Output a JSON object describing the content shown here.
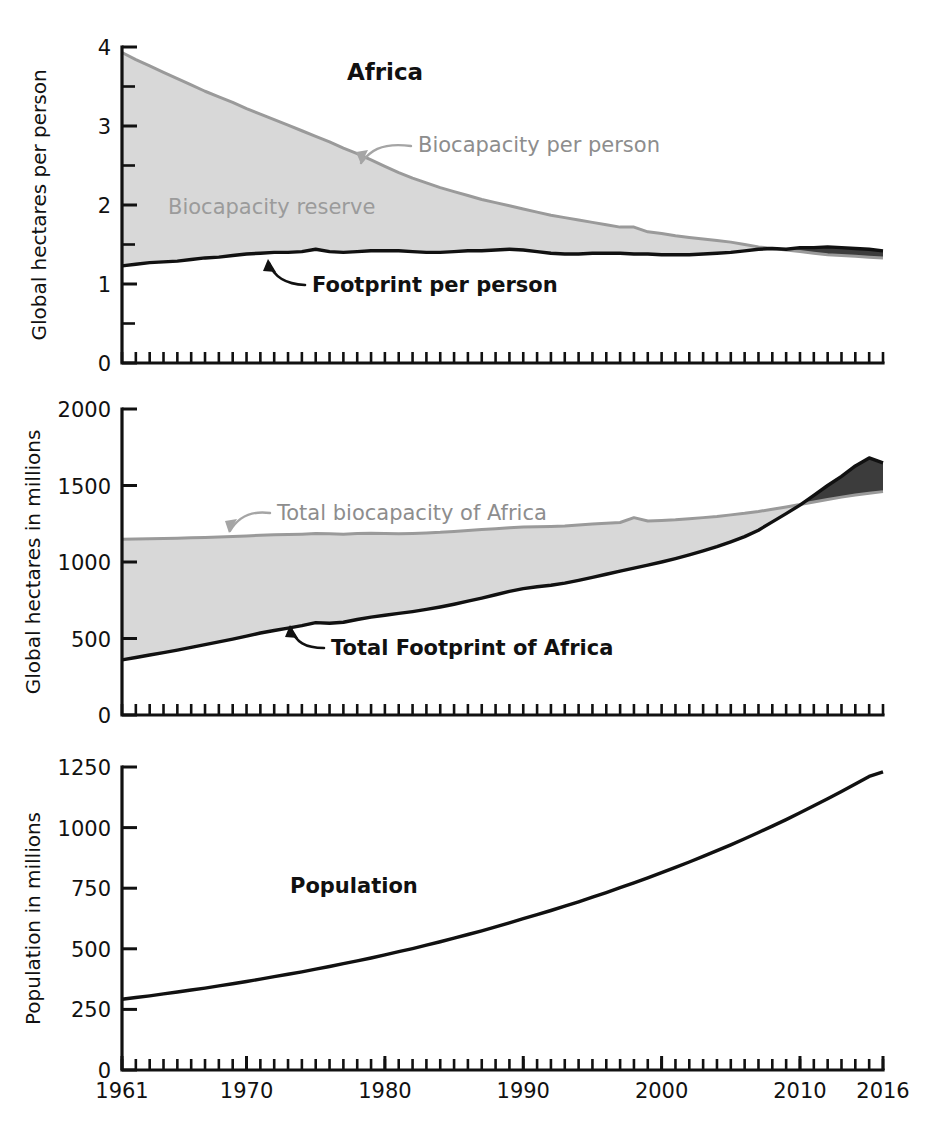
{
  "figure": {
    "title": "Africa",
    "x_axis": {
      "label": "",
      "ticks": [
        1961,
        1970,
        1980,
        1990,
        2000,
        2010,
        2016
      ],
      "tick_labels": [
        "1961",
        "1970",
        "1980",
        "1990",
        "2000",
        "2010",
        "2016"
      ],
      "range": [
        1961,
        2016
      ],
      "minor_tick_interval": 1
    },
    "colors": {
      "reserve_fill": "#d8d8d8",
      "overshoot_fill": "#3c3c3c",
      "biocapacity_line": "#9a9a9a",
      "footprint_line": "#111111",
      "annotation_gray": "#8d8d8d",
      "annotation_dark": "#111111",
      "background": "#ffffff"
    }
  },
  "panels": [
    {
      "id": "per-person",
      "ylabel": "Global hectares per person",
      "ytick_labels": [
        "0",
        "1",
        "2",
        "3",
        "4"
      ],
      "annotations": {
        "title": "Africa",
        "biocapacity": "Biocapacity per person",
        "reserve": "Biocapacity reserve",
        "footprint": "Footprint per person"
      }
    },
    {
      "id": "total",
      "ylabel": "Global hectares in millions",
      "ytick_labels": [
        "0",
        "500",
        "1000",
        "1500",
        "2000"
      ],
      "annotations": {
        "biocapacity": "Total biocapacity of Africa",
        "footprint": "Total Footprint of Africa"
      }
    },
    {
      "id": "population",
      "ylabel": "Population in millions",
      "ytick_labels": [
        "0",
        "250",
        "500",
        "750",
        "1000",
        "1250"
      ],
      "annotations": {
        "population": "Population"
      }
    }
  ],
  "chart_data": [
    {
      "type": "area",
      "id": "per-person",
      "title": "Africa",
      "xlabel": "",
      "ylabel": "Global hectares per person",
      "xlim": [
        1961,
        2016
      ],
      "ylim": [
        0,
        4
      ],
      "yticks": [
        0,
        1,
        2,
        3,
        4
      ],
      "yminor": [
        0.5,
        1.5,
        2.5,
        3.5
      ],
      "grid": false,
      "legend": "inline-annotations",
      "x": [
        1961,
        1962,
        1963,
        1964,
        1965,
        1966,
        1967,
        1968,
        1969,
        1970,
        1971,
        1972,
        1973,
        1974,
        1975,
        1976,
        1977,
        1978,
        1979,
        1980,
        1981,
        1982,
        1983,
        1984,
        1985,
        1986,
        1987,
        1988,
        1989,
        1990,
        1991,
        1992,
        1993,
        1994,
        1995,
        1996,
        1997,
        1998,
        1999,
        2000,
        2001,
        2002,
        2003,
        2004,
        2005,
        2006,
        2007,
        2008,
        2009,
        2010,
        2011,
        2012,
        2013,
        2014,
        2015,
        2016
      ],
      "series": [
        {
          "name": "Biocapacity per person",
          "color": "#9a9a9a",
          "values": [
            3.93,
            3.84,
            3.76,
            3.68,
            3.6,
            3.52,
            3.44,
            3.37,
            3.3,
            3.22,
            3.15,
            3.08,
            3.01,
            2.94,
            2.87,
            2.8,
            2.72,
            2.65,
            2.57,
            2.49,
            2.41,
            2.34,
            2.28,
            2.22,
            2.17,
            2.12,
            2.07,
            2.03,
            1.99,
            1.95,
            1.91,
            1.87,
            1.84,
            1.81,
            1.78,
            1.75,
            1.72,
            1.72,
            1.66,
            1.64,
            1.61,
            1.59,
            1.57,
            1.55,
            1.53,
            1.5,
            1.47,
            1.45,
            1.43,
            1.41,
            1.39,
            1.37,
            1.36,
            1.35,
            1.34,
            1.33
          ]
        },
        {
          "name": "Footprint per person",
          "color": "#111111",
          "values": [
            1.23,
            1.25,
            1.27,
            1.28,
            1.29,
            1.31,
            1.33,
            1.34,
            1.36,
            1.38,
            1.39,
            1.4,
            1.4,
            1.41,
            1.44,
            1.41,
            1.4,
            1.41,
            1.42,
            1.42,
            1.42,
            1.41,
            1.4,
            1.4,
            1.41,
            1.42,
            1.42,
            1.43,
            1.44,
            1.43,
            1.41,
            1.39,
            1.38,
            1.38,
            1.39,
            1.39,
            1.39,
            1.38,
            1.38,
            1.37,
            1.37,
            1.37,
            1.38,
            1.39,
            1.4,
            1.42,
            1.44,
            1.45,
            1.44,
            1.46,
            1.46,
            1.47,
            1.46,
            1.45,
            1.44,
            1.42
          ]
        }
      ],
      "fill_regions": [
        {
          "name": "Biocapacity reserve",
          "color": "#d8d8d8",
          "between": [
            "Biocapacity per person",
            "Footprint per person"
          ],
          "where": "biocapacity > footprint"
        },
        {
          "name": "Overshoot",
          "color": "#3c3c3c",
          "between": [
            "Footprint per person",
            "Biocapacity per person"
          ],
          "where": "footprint > biocapacity",
          "starts_year": 2006
        }
      ]
    },
    {
      "type": "area",
      "id": "total",
      "title": "",
      "xlabel": "",
      "ylabel": "Global hectares in millions",
      "xlim": [
        1961,
        2016
      ],
      "ylim": [
        0,
        2000
      ],
      "yticks": [
        0,
        500,
        1000,
        1500,
        2000
      ],
      "grid": false,
      "legend": "inline-annotations",
      "x": [
        1961,
        1962,
        1963,
        1964,
        1965,
        1966,
        1967,
        1968,
        1969,
        1970,
        1971,
        1972,
        1973,
        1974,
        1975,
        1976,
        1977,
        1978,
        1979,
        1980,
        1981,
        1982,
        1983,
        1984,
        1985,
        1986,
        1987,
        1988,
        1989,
        1990,
        1991,
        1992,
        1993,
        1994,
        1995,
        1996,
        1997,
        1998,
        1999,
        2000,
        2001,
        2002,
        2003,
        2004,
        2005,
        2006,
        2007,
        2008,
        2009,
        2010,
        2011,
        2012,
        2013,
        2014,
        2015,
        2016
      ],
      "series": [
        {
          "name": "Total biocapacity of Africa",
          "color": "#9a9a9a",
          "values": [
            1148,
            1150,
            1152,
            1154,
            1156,
            1158,
            1160,
            1163,
            1166,
            1170,
            1175,
            1178,
            1180,
            1182,
            1186,
            1184,
            1182,
            1186,
            1188,
            1186,
            1184,
            1186,
            1190,
            1194,
            1200,
            1206,
            1212,
            1218,
            1224,
            1228,
            1230,
            1232,
            1236,
            1242,
            1248,
            1254,
            1258,
            1290,
            1268,
            1272,
            1276,
            1282,
            1290,
            1298,
            1308,
            1318,
            1330,
            1345,
            1360,
            1376,
            1392,
            1408,
            1424,
            1438,
            1450,
            1460
          ]
        },
        {
          "name": "Total Footprint of Africa",
          "color": "#111111",
          "values": [
            360,
            376,
            392,
            408,
            424,
            442,
            460,
            478,
            496,
            516,
            536,
            552,
            568,
            584,
            604,
            600,
            606,
            624,
            640,
            652,
            664,
            676,
            690,
            706,
            724,
            744,
            764,
            786,
            808,
            826,
            838,
            848,
            862,
            880,
            900,
            920,
            940,
            960,
            980,
            1000,
            1022,
            1046,
            1072,
            1100,
            1132,
            1166,
            1208,
            1262,
            1316,
            1372,
            1436,
            1500,
            1560,
            1628,
            1680,
            1648
          ]
        }
      ],
      "fill_regions": [
        {
          "name": "Biocapacity reserve",
          "color": "#d8d8d8",
          "between": [
            "Total biocapacity of Africa",
            "Total Footprint of Africa"
          ],
          "where": "biocapacity > footprint"
        },
        {
          "name": "Overshoot",
          "color": "#3c3c3c",
          "between": [
            "Total Footprint of Africa",
            "Total biocapacity of Africa"
          ],
          "where": "footprint > biocapacity",
          "starts_year": 2006
        }
      ]
    },
    {
      "type": "line",
      "id": "population",
      "title": "",
      "xlabel": "",
      "ylabel": "Population in millions",
      "xlim": [
        1961,
        2016
      ],
      "ylim": [
        0,
        1250
      ],
      "yticks": [
        0,
        250,
        500,
        750,
        1000,
        1250
      ],
      "grid": false,
      "legend": "inline-annotation",
      "x": [
        1961,
        1962,
        1963,
        1964,
        1965,
        1966,
        1967,
        1968,
        1969,
        1970,
        1971,
        1972,
        1973,
        1974,
        1975,
        1976,
        1977,
        1978,
        1979,
        1980,
        1981,
        1982,
        1983,
        1984,
        1985,
        1986,
        1987,
        1988,
        1989,
        1990,
        1991,
        1992,
        1993,
        1994,
        1995,
        1996,
        1997,
        1998,
        1999,
        2000,
        2001,
        2002,
        2003,
        2004,
        2005,
        2006,
        2007,
        2008,
        2009,
        2010,
        2011,
        2012,
        2013,
        2014,
        2015,
        2016
      ],
      "series": [
        {
          "name": "Population",
          "color": "#111111",
          "values": [
            292,
            299,
            306,
            314,
            322,
            330,
            338,
            347,
            356,
            365,
            375,
            385,
            395,
            405,
            416,
            427,
            439,
            450,
            462,
            475,
            488,
            501,
            515,
            529,
            544,
            559,
            574,
            590,
            607,
            624,
            641,
            658,
            676,
            694,
            713,
            732,
            752,
            772,
            793,
            814,
            836,
            858,
            881,
            905,
            929,
            954,
            980,
            1006,
            1033,
            1061,
            1090,
            1119,
            1149,
            1180,
            1211,
            1230
          ]
        }
      ]
    }
  ]
}
